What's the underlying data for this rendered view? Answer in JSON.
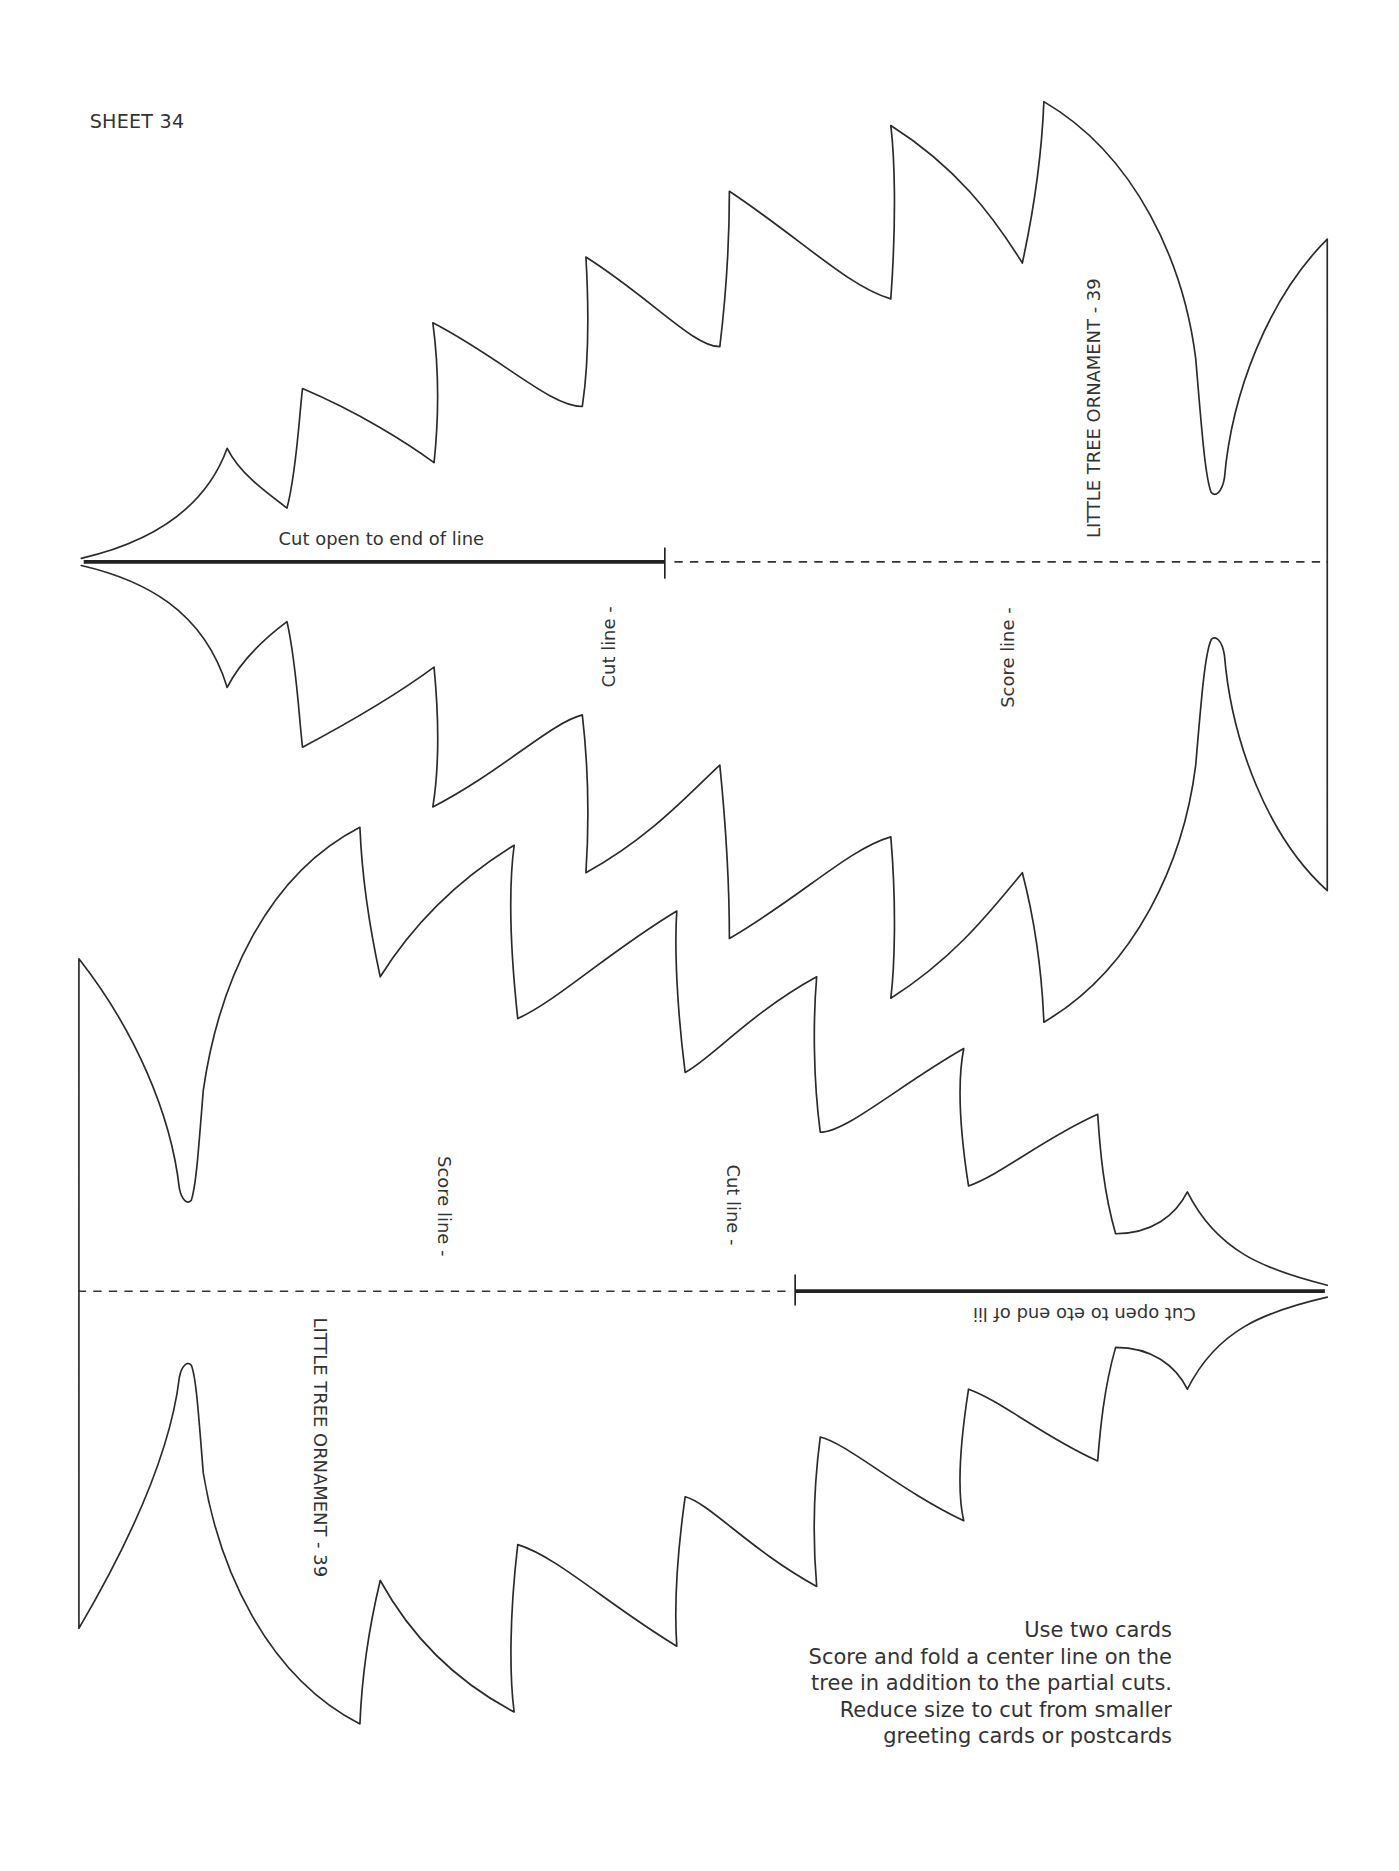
{
  "sheet": {
    "title": "SHEET 34"
  },
  "templates": [
    {
      "name": "LITTLE TREE ORNAMENT - 39",
      "orientation": "tip-left",
      "cut_instruction": "Cut open to end of line",
      "cut_label": "Cut line -",
      "score_label": "Score line -"
    },
    {
      "name": "LITTLE TREE ORNAMENT - 39",
      "orientation": "tip-right (rotated 180°)",
      "cut_instruction": "Cut open to eto end of lii",
      "cut_label": "Cut line -",
      "score_label": "Score line -"
    }
  ],
  "instructions": {
    "lines": [
      "Use two cards",
      "Score and fold a center line on the",
      "tree in addition to the partial cuts.",
      "Reduce size to cut from smaller",
      "greeting cards or postcards"
    ]
  },
  "colors": {
    "paper": "#ffffff",
    "ink": "#2a2a2a"
  }
}
